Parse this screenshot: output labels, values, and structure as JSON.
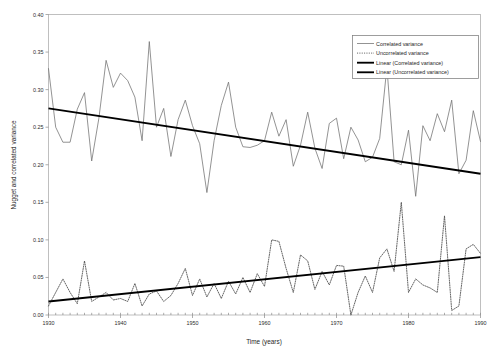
{
  "chart_data": {
    "type": "line",
    "title": "",
    "xlabel": "Time (years)",
    "ylabel": "Nugget and correlated variance",
    "xlim": [
      1930,
      1990
    ],
    "ylim": [
      0.0,
      0.4
    ],
    "ytick_labels": [
      "0.40",
      "0.35",
      "0.30",
      "0.25",
      "0.20",
      "0.15",
      "0.10",
      "0.05",
      "0.00"
    ],
    "ytick_values": [
      0.4,
      0.35,
      0.3,
      0.25,
      0.2,
      0.15,
      0.1,
      0.05,
      0.0
    ],
    "xtick_labels": [
      "1930",
      "1940",
      "1950",
      "1960",
      "1970",
      "1980",
      "1990"
    ],
    "xtick_values": [
      1930,
      1940,
      1950,
      1960,
      1970,
      1980,
      1990
    ],
    "minor_xtick_interval": 1,
    "grid": false,
    "legend_position": "top-right",
    "x": [
      1930,
      1931,
      1932,
      1933,
      1934,
      1935,
      1936,
      1937,
      1938,
      1939,
      1940,
      1941,
      1942,
      1943,
      1944,
      1945,
      1946,
      1947,
      1948,
      1949,
      1950,
      1951,
      1952,
      1953,
      1954,
      1955,
      1956,
      1957,
      1958,
      1959,
      1960,
      1961,
      1962,
      1963,
      1964,
      1965,
      1966,
      1967,
      1968,
      1969,
      1970,
      1971,
      1972,
      1973,
      1974,
      1975,
      1976,
      1977,
      1978,
      1979,
      1980,
      1981,
      1982,
      1983,
      1984,
      1985,
      1986,
      1987,
      1988,
      1989,
      1990
    ],
    "series": [
      {
        "name": "Correlated variance",
        "style": "thin-solid",
        "color": "#6f6f6f",
        "values": [
          0.328,
          0.25,
          0.23,
          0.23,
          0.274,
          0.296,
          0.205,
          0.262,
          0.339,
          0.303,
          0.322,
          0.312,
          0.29,
          0.232,
          0.364,
          0.25,
          0.275,
          0.211,
          0.26,
          0.286,
          0.252,
          0.228,
          0.163,
          0.232,
          0.279,
          0.31,
          0.25,
          0.224,
          0.223,
          0.226,
          0.232,
          0.27,
          0.238,
          0.26,
          0.198,
          0.226,
          0.27,
          0.222,
          0.195,
          0.255,
          0.262,
          0.208,
          0.25,
          0.233,
          0.204,
          0.21,
          0.235,
          0.33,
          0.204,
          0.2,
          0.246,
          0.158,
          0.252,
          0.232,
          0.268,
          0.244,
          0.286,
          0.188,
          0.206,
          0.272,
          0.231
        ]
      },
      {
        "name": "Uncorrelated variance",
        "style": "dotted",
        "color": "#4a4a4a",
        "values": [
          0.012,
          0.03,
          0.048,
          0.03,
          0.015,
          0.072,
          0.018,
          0.024,
          0.03,
          0.02,
          0.022,
          0.018,
          0.042,
          0.012,
          0.028,
          0.032,
          0.018,
          0.026,
          0.042,
          0.062,
          0.026,
          0.048,
          0.024,
          0.042,
          0.022,
          0.045,
          0.028,
          0.05,
          0.03,
          0.055,
          0.038,
          0.1,
          0.098,
          0.062,
          0.03,
          0.08,
          0.072,
          0.034,
          0.058,
          0.04,
          0.066,
          0.065,
          0.0,
          0.03,
          0.052,
          0.03,
          0.076,
          0.088,
          0.058,
          0.15,
          0.03,
          0.048,
          0.04,
          0.036,
          0.03,
          0.132,
          0.006,
          0.012,
          0.088,
          0.094,
          0.082
        ]
      }
    ],
    "trendlines": [
      {
        "name": "Linear (Correlated variance)",
        "style": "thick-solid",
        "color": "#000000",
        "x_start": 1930,
        "y_start": 0.275,
        "x_end": 1990,
        "y_end": 0.188
      },
      {
        "name": "Linear (Uncorrelated variance)",
        "style": "thick-solid",
        "color": "#000000",
        "x_start": 1930,
        "y_start": 0.018,
        "x_end": 1990,
        "y_end": 0.077
      }
    ],
    "legend_entries": [
      {
        "label": "Correlated variance",
        "style": "thin-solid"
      },
      {
        "label": "Uncorrelated variance",
        "style": "dotted"
      },
      {
        "label": "Linear (Correlated variance)",
        "style": "thick-solid"
      },
      {
        "label": "Linear (Uncorrelated variance)",
        "style": "thick-solid"
      }
    ]
  }
}
